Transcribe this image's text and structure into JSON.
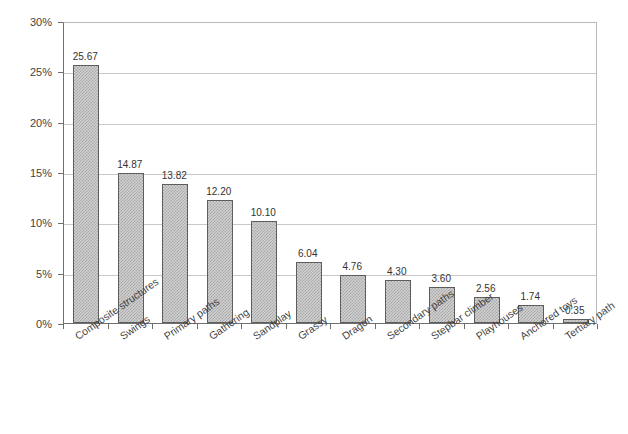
{
  "chart_data": {
    "type": "bar",
    "title": "",
    "subtitle": "",
    "xlabel": "",
    "ylabel": "",
    "ylim": [
      0,
      30
    ],
    "ytick_values": [
      30,
      25,
      20,
      15,
      10,
      5,
      0
    ],
    "ytick_labels": [
      "30%",
      "25%",
      "20%",
      "15%",
      "10%",
      "5%",
      "0%"
    ],
    "grid": "horizontal",
    "legend": "none",
    "value_label_format": "two-decimal",
    "categories": [
      "Composite structures",
      "Swings",
      "Primary paths",
      "Gathering",
      "Sandplay",
      "Grassy",
      "Dragon",
      "Secondary paths",
      "Stepbar climber",
      "Playhouses",
      "Anchored toys",
      "Tertiary path"
    ],
    "values": [
      25.67,
      14.87,
      13.82,
      12.2,
      10.1,
      6.04,
      4.76,
      4.3,
      3.6,
      2.56,
      1.74,
      0.35
    ],
    "value_labels": [
      "25.67",
      "14.87",
      "13.82",
      "12.20",
      "10.10",
      "6.04",
      "4.76",
      "4.30",
      "3.60",
      "2.56",
      "1.74",
      "0.35"
    ],
    "colors": {
      "bar_fill": "#d0d0d0",
      "bar_pattern": "#a8a8a8",
      "bar_border": "#5d5d5d",
      "gridline": "#c9c9c9",
      "axis": "#6f6f6f",
      "plot_border_light": "#b9b9b9",
      "text": "#3f3f3f",
      "background": "#ffffff"
    }
  }
}
